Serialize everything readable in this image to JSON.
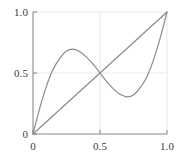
{
  "chart_data": {
    "type": "line",
    "title": "",
    "xlabel": "",
    "ylabel": "",
    "xlim": [
      0,
      1
    ],
    "ylim": [
      0,
      1
    ],
    "grid": true,
    "grid_color": "#e8e8ec",
    "legend": "none",
    "axis_color": "#8a8a8a",
    "curve_color": "#8a8a8a",
    "xticks": [
      {
        "value": 0,
        "label": "0"
      },
      {
        "value": 0.5,
        "label": "0.5"
      },
      {
        "value": 1,
        "label": "1.0"
      }
    ],
    "yticks": [
      {
        "value": 0,
        "label": "0"
      },
      {
        "value": 0.5,
        "label": "0.5"
      },
      {
        "value": 1,
        "label": "1.0"
      }
    ],
    "series": [
      {
        "name": "identity",
        "kind": "line",
        "points": [
          [
            0,
            0
          ],
          [
            1,
            1
          ]
        ]
      },
      {
        "name": "wavy-cubic",
        "kind": "curve",
        "points": [
          [
            0.0,
            0.0
          ],
          [
            0.05,
            0.21
          ],
          [
            0.1,
            0.39
          ],
          [
            0.15,
            0.53
          ],
          [
            0.2,
            0.62
          ],
          [
            0.25,
            0.68
          ],
          [
            0.3,
            0.695
          ],
          [
            0.35,
            0.675
          ],
          [
            0.4,
            0.63
          ],
          [
            0.45,
            0.57
          ],
          [
            0.5,
            0.5
          ],
          [
            0.55,
            0.43
          ],
          [
            0.6,
            0.37
          ],
          [
            0.65,
            0.325
          ],
          [
            0.7,
            0.305
          ],
          [
            0.75,
            0.32
          ],
          [
            0.8,
            0.38
          ],
          [
            0.85,
            0.47
          ],
          [
            0.9,
            0.61
          ],
          [
            0.95,
            0.79
          ],
          [
            1.0,
            1.0
          ]
        ]
      }
    ]
  },
  "axes": {
    "left_px": 33,
    "right_px": 167,
    "top_px": 12,
    "bottom_px": 134
  }
}
